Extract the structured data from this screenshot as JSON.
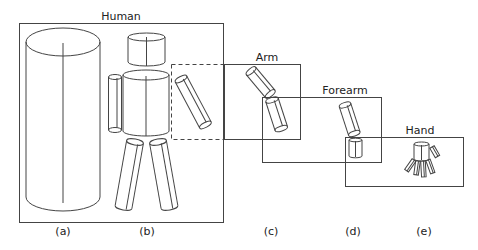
{
  "figure": {
    "type": "hierarchical body-part cylinder model diagram",
    "colors": {
      "stroke": "#444444",
      "background": "#ffffff"
    },
    "boxes": [
      {
        "id": "human",
        "title": "Human"
      },
      {
        "id": "arm",
        "title": "Arm"
      },
      {
        "id": "forearm",
        "title": "Forearm"
      },
      {
        "id": "hand",
        "title": "Hand"
      }
    ],
    "panels": [
      {
        "id": "a",
        "label": "(a)",
        "content": "single cylinder (whole body)"
      },
      {
        "id": "b",
        "label": "(b)",
        "content": "body as head, torso, arms, legs cylinders"
      },
      {
        "id": "c",
        "label": "(c)",
        "content": "arm as upper arm and forearm"
      },
      {
        "id": "d",
        "label": "(d)",
        "content": "forearm and hand"
      },
      {
        "id": "e",
        "label": "(e)",
        "content": "hand with palm and five fingers"
      }
    ]
  }
}
